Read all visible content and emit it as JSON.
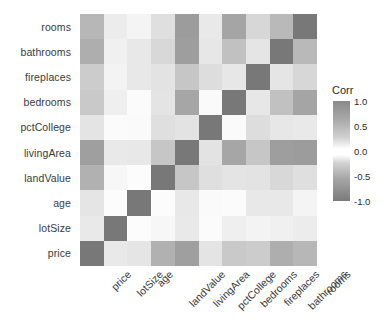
{
  "chart_data": {
    "type": "heatmap",
    "title": "",
    "xlabel": "",
    "ylabel": "",
    "grid": false,
    "legend_position": "right",
    "colorbar": {
      "title": "Corr",
      "ticks": [
        "1.0",
        "0.5",
        "0.0",
        "-0.5",
        "-1.0"
      ],
      "tick_values": [
        1.0,
        0.5,
        0.0,
        -0.5,
        -1.0
      ],
      "range": [
        -1.0,
        1.0
      ],
      "color_low": "#7b7b7b",
      "color_mid": "#ffffff",
      "color_high": "#8a8a8a"
    },
    "x_categories": [
      "price",
      "lotSize",
      "age",
      "landValue",
      "livingArea",
      "pctCollege",
      "bedrooms",
      "fireplaces",
      "bathrooms",
      "rooms"
    ],
    "y_categories": [
      "rooms",
      "bathrooms",
      "fireplaces",
      "bedrooms",
      "pctCollege",
      "livingArea",
      "landValue",
      "age",
      "lotSize",
      "price"
    ],
    "rows": [
      {
        "label": "rooms",
        "values": [
          0.53,
          0.14,
          0.08,
          0.24,
          0.73,
          0.16,
          0.67,
          0.3,
          0.52,
          1.0
        ]
      },
      {
        "label": "bathrooms",
        "values": [
          0.6,
          0.11,
          -0.17,
          0.29,
          0.72,
          0.18,
          0.46,
          0.19,
          1.0,
          0.52
        ]
      },
      {
        "label": "fireplaces",
        "values": [
          0.38,
          0.09,
          -0.17,
          0.21,
          0.42,
          0.25,
          0.18,
          1.0,
          0.19,
          0.3
        ]
      },
      {
        "label": "bedrooms",
        "values": [
          0.4,
          0.12,
          -0.03,
          0.2,
          0.66,
          0.04,
          1.0,
          0.18,
          0.46,
          0.67
        ]
      },
      {
        "label": "pctCollege",
        "values": [
          0.2,
          -0.03,
          -0.04,
          0.24,
          0.21,
          1.0,
          0.04,
          0.25,
          0.18,
          0.16
        ]
      },
      {
        "label": "livingArea",
        "values": [
          0.71,
          0.16,
          -0.17,
          0.42,
          1.0,
          0.21,
          0.66,
          0.42,
          0.72,
          0.73
        ]
      },
      {
        "label": "landValue",
        "values": [
          0.58,
          0.06,
          -0.02,
          1.0,
          0.42,
          0.24,
          0.2,
          0.21,
          0.29,
          0.24
        ]
      },
      {
        "label": "age",
        "values": [
          -0.19,
          -0.02,
          1.0,
          -0.02,
          -0.17,
          -0.04,
          -0.03,
          -0.17,
          -0.17,
          0.08
        ]
      },
      {
        "label": "lotSize",
        "values": [
          0.16,
          1.0,
          -0.02,
          0.06,
          0.16,
          -0.03,
          0.12,
          0.09,
          0.11,
          0.14
        ]
      },
      {
        "label": "price",
        "values": [
          1.0,
          0.16,
          -0.19,
          0.58,
          0.71,
          0.2,
          0.4,
          0.38,
          0.6,
          0.53
        ]
      }
    ]
  }
}
